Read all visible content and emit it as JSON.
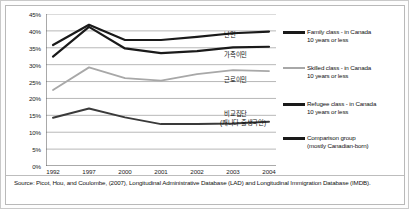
{
  "chart_data": {
    "type": "line",
    "title": "",
    "subtitle": "",
    "xlabel": "",
    "ylabel": "",
    "grid": true,
    "legend_position": "right",
    "ylim": [
      0,
      45
    ],
    "y_ticks": [
      "45%",
      "40%",
      "35%",
      "30%",
      "25%",
      "20%",
      "15%",
      "10%",
      "5%",
      "0%"
    ],
    "categories": [
      "1992",
      "1997",
      "2000",
      "2001",
      "2002",
      "2003",
      "2004"
    ],
    "series": [
      {
        "name": "Refugee class  - in Canada 10 years or less",
        "name_ko": "난민",
        "color": "#1a1a1a",
        "width": 2.2,
        "values": [
          35.8,
          41.8,
          37.3,
          37.3,
          38.2,
          39.3,
          39.8
        ]
      },
      {
        "name": "Family class  - in Canada 10 years or less",
        "name_ko": "가족이민",
        "color": "#1a1a1a",
        "width": 2.2,
        "values": [
          32.4,
          41.2,
          34.8,
          33.4,
          34.0,
          35.1,
          35.3
        ]
      },
      {
        "name": "Skilled class  - in Canada 10 years or less",
        "name_ko": "근로이민",
        "color": "#a8a8a8",
        "width": 1.8,
        "values": [
          22.5,
          29.2,
          26.0,
          25.3,
          27.2,
          28.4,
          28.1
        ]
      },
      {
        "name": "Comparison group (mostly Canadian-born)",
        "name_ko": "비교집단 (캐나다 출생국인)",
        "color": "#3a3a3a",
        "width": 2.0,
        "values": [
          14.3,
          17.0,
          14.4,
          12.4,
          12.4,
          12.6,
          13.1
        ]
      }
    ]
  },
  "annotations": [
    {
      "label": "난민",
      "x": 218,
      "y": 17
    },
    {
      "label": "가족이민",
      "x": 218,
      "y": 37
    },
    {
      "label": "근로이민",
      "x": 218,
      "y": 62
    },
    {
      "label": "비교집단",
      "x": 218,
      "y": 96
    },
    {
      "label": "(캐나다 출생국인)",
      "x": 214,
      "y": 105
    }
  ],
  "legend": {
    "items": [
      {
        "label": "Family class  - in Canada\n10 years or less",
        "color": "#1a1a1a",
        "thickness": 3,
        "top": 12
      },
      {
        "label": "Skilled class  - in Canada\n10 years or less",
        "color": "#a8a8a8",
        "thickness": 2,
        "top": 48
      },
      {
        "label": "Refugee class  - in Canada\n10 years or less",
        "color": "#1a1a1a",
        "thickness": 3,
        "top": 84
      },
      {
        "label": "Comparison group\n(mostly Canadian-born)",
        "color": "#1a1a1a",
        "thickness": 3,
        "top": 118
      }
    ]
  },
  "source": {
    "text": "Source: Picot, Hou, and Coulombe, (2007), Longitudinal Administrative Database (LAD) and Longitudinal Immigration Database (IMDB)."
  }
}
